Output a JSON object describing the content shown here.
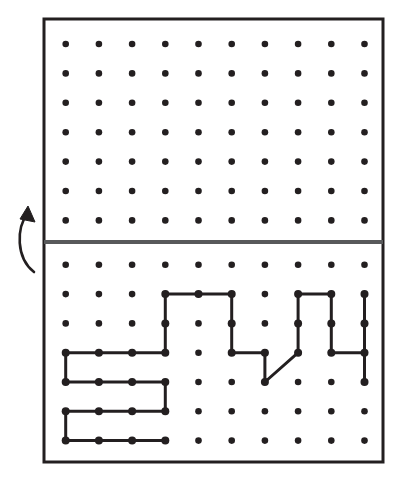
{
  "figure": {
    "title": "Dot-grid fold diagram",
    "background_color": "#ffffff",
    "ink_color": "#231f20",
    "fold_line_color": "#58595b"
  },
  "frame": {
    "name": "outer-border",
    "x": 44,
    "y": 19,
    "width": 339,
    "height": 443,
    "stroke_width": 3,
    "stroke": "#231f20",
    "fill": "#ffffff"
  },
  "fold_line": {
    "name": "fold-line",
    "y": 242,
    "x_start": 44,
    "x_end": 383,
    "stroke_width": 4,
    "stroke": "#58595b",
    "label": "fold"
  },
  "fold_arrow": {
    "name": "fold-arrow",
    "direction": "up",
    "path": "M 34 272 C 16 258, 16 228, 28 213",
    "head_points": "28,206 35,222 20,219",
    "stroke": "#231f20",
    "stroke_width": 2.6
  },
  "grid": {
    "columns": 10,
    "rows_top": 7,
    "rows_bottom": 7,
    "x_origin": 65.7,
    "x_step": 33.2,
    "dot_radius": 3.3,
    "dot_color": "#231f20",
    "top_y_origin": 44,
    "top_y_step": 29.4,
    "bottom_y_origin": 264.8,
    "bottom_y_step": 29.3
  },
  "top_panel": {
    "name": "upper-half",
    "has_drawing": false,
    "dot_count": 70
  },
  "bottom_panel": {
    "name": "lower-half",
    "has_drawing": true,
    "dot_count": 70,
    "polyline_stroke": "#231f20",
    "polyline_stroke_width": 3,
    "polyline_node_radius": 4,
    "polyline_points_grid": [
      [
        0,
        3
      ],
      [
        3,
        3
      ],
      [
        3,
        1
      ],
      [
        5,
        1
      ],
      [
        5,
        3
      ],
      [
        6,
        3
      ],
      [
        6,
        4
      ],
      [
        7,
        3
      ],
      [
        7,
        1
      ],
      [
        8,
        1
      ],
      [
        8,
        3
      ],
      [
        9,
        3
      ],
      [
        9,
        1
      ],
      [
        9,
        4
      ]
    ],
    "serpentine_points_grid": [
      [
        0,
        3
      ],
      [
        0,
        4
      ],
      [
        3,
        4
      ],
      [
        3,
        5
      ],
      [
        0,
        5
      ],
      [
        0,
        6
      ],
      [
        3,
        6
      ]
    ],
    "node_dots_grid": [
      [
        0,
        3
      ],
      [
        1,
        3
      ],
      [
        2,
        3
      ],
      [
        3,
        3
      ],
      [
        3,
        2
      ],
      [
        3,
        1
      ],
      [
        4,
        1
      ],
      [
        5,
        1
      ],
      [
        5,
        2
      ],
      [
        5,
        3
      ],
      [
        6,
        3
      ],
      [
        6,
        4
      ],
      [
        7,
        3
      ],
      [
        7,
        2
      ],
      [
        7,
        1
      ],
      [
        8,
        1
      ],
      [
        8,
        2
      ],
      [
        8,
        3
      ],
      [
        9,
        3
      ],
      [
        9,
        1
      ],
      [
        9,
        2
      ],
      [
        9,
        4
      ],
      [
        0,
        4
      ],
      [
        1,
        4
      ],
      [
        2,
        4
      ],
      [
        3,
        4
      ],
      [
        3,
        5
      ],
      [
        0,
        5
      ],
      [
        1,
        5
      ],
      [
        2,
        5
      ],
      [
        0,
        6
      ],
      [
        1,
        6
      ],
      [
        2,
        6
      ],
      [
        3,
        6
      ]
    ]
  }
}
